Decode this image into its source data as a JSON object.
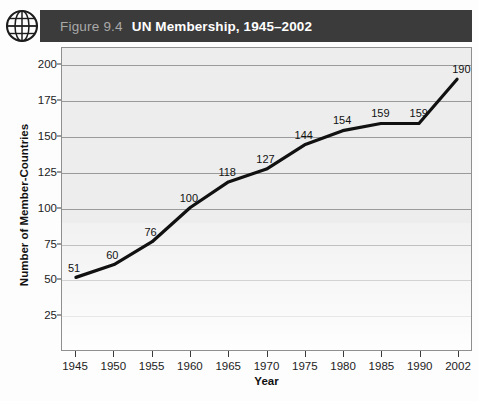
{
  "header": {
    "figure_number": "Figure 9.4",
    "title": "UN Membership, 1945–2002",
    "icon": "globe-icon",
    "bar_color": "#3b3b3b",
    "number_color": "#a9a9a9",
    "title_color": "#ffffff"
  },
  "chart_data": {
    "type": "line",
    "title": "UN Membership, 1945–2002",
    "xlabel": "Year",
    "ylabel": "Number of Member-Countries",
    "categories": [
      "1945",
      "1950",
      "1955",
      "1960",
      "1965",
      "1970",
      "1975",
      "1980",
      "1985",
      "1990",
      "2002"
    ],
    "values": [
      51,
      60,
      76,
      100,
      118,
      127,
      144,
      154,
      159,
      159,
      190
    ],
    "point_labels": [
      "51",
      "60",
      "76",
      "100",
      "118",
      "127",
      "144",
      "154",
      "159",
      "159",
      "190 *"
    ],
    "ylim": [
      0,
      212
    ],
    "yticks": [
      25,
      50,
      75,
      100,
      125,
      150,
      175,
      200
    ],
    "ytick_labels": [
      "25",
      "50",
      "75",
      "100",
      "125",
      "150",
      "175",
      "200"
    ],
    "grid": true,
    "legend": "none",
    "line_color": "#111111",
    "plot_background": "#ededed"
  }
}
